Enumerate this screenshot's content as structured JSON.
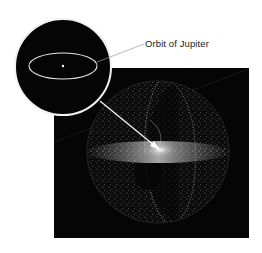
{
  "figure": {
    "type": "illustration",
    "callout": {
      "label": "Orbit of Jupiter"
    },
    "colors": {
      "background": "#ffffff",
      "space": "#050505",
      "particles": "#d8d8d8",
      "inset_ring": "#f2f2f2",
      "leader_line": "#9a9a9a"
    }
  }
}
